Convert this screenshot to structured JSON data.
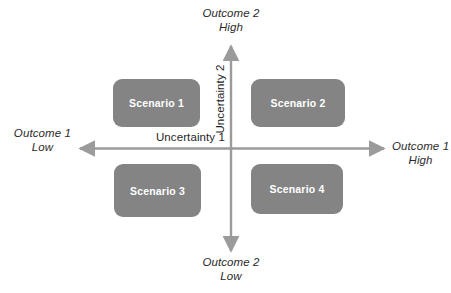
{
  "diagram": {
    "type": "scenario-matrix",
    "axes": {
      "horizontal": {
        "uncertainty_label": "Uncertainty 1",
        "low_end": {
          "line1": "Outcome 1",
          "line2": "Low"
        },
        "high_end": {
          "line1": "Outcome 1",
          "line2": "High"
        }
      },
      "vertical": {
        "uncertainty_label": "Uncertainty 2",
        "high_end": {
          "line1": "Outcome 2",
          "line2": "High"
        },
        "low_end": {
          "line1": "Outcome 2",
          "line2": "Low"
        }
      }
    },
    "quadrants": [
      {
        "position": "top-left",
        "label": "Scenario 1"
      },
      {
        "position": "top-right",
        "label": "Scenario 2"
      },
      {
        "position": "bottom-left",
        "label": "Scenario 3"
      },
      {
        "position": "bottom-right",
        "label": "Scenario 4"
      }
    ],
    "colors": {
      "box_fill": "#848484",
      "box_text": "#ffffff",
      "axis_line": "#9b9b9b",
      "label_text": "#2b2b2b",
      "background": "#ffffff"
    }
  }
}
